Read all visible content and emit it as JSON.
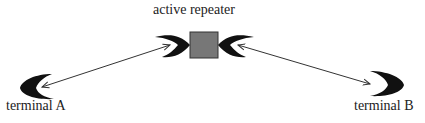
{
  "diagram": {
    "repeater": {
      "label": "active repeater",
      "color": "#777777"
    },
    "terminal_a": {
      "label": "terminal A"
    },
    "terminal_b": {
      "label": "terminal B"
    },
    "links": [
      {
        "from": "terminal A",
        "to": "active repeater",
        "type": "bidirectional"
      },
      {
        "from": "active repeater",
        "to": "terminal B",
        "type": "bidirectional"
      }
    ]
  }
}
